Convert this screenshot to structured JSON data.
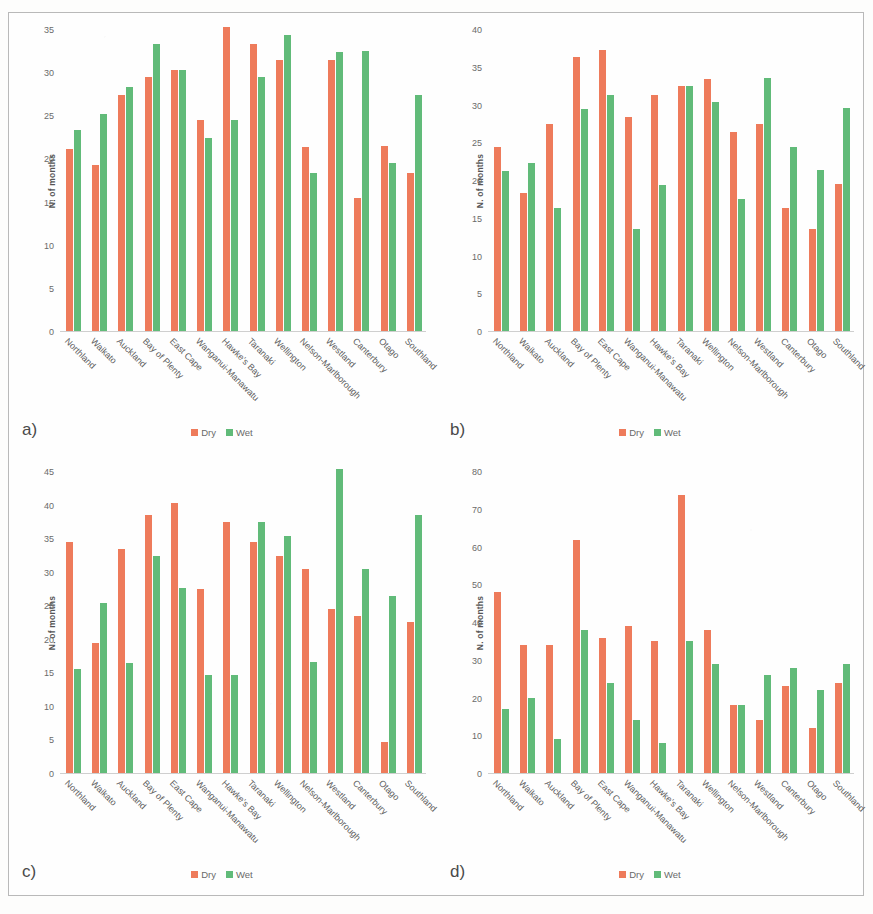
{
  "figure": {
    "colors": {
      "dry": "#ee7b5b",
      "wet": "#61bb79",
      "border": "#b9b9b9",
      "text": "#5e5e5e"
    },
    "legend": {
      "dry_label": "Dry",
      "wet_label": "Wet"
    },
    "ylabel": "N. of months",
    "categories": [
      "Northland",
      "Waikato",
      "Auckland",
      "Bay of Plenty",
      "East Cape",
      "Wanganui-Manawatu",
      "Hawke's Bay",
      "Taranaki",
      "Wellington",
      "Nelson-Marlborough",
      "Westland",
      "Canterbury",
      "Otago",
      "Southland"
    ],
    "panels": [
      {
        "letter": "a)"
      },
      {
        "letter": "b)"
      },
      {
        "letter": "c)"
      },
      {
        "letter": "d)"
      }
    ]
  },
  "chart_data": [
    {
      "type": "bar",
      "panel": "a)",
      "title": "",
      "xlabel": "",
      "ylabel": "N. of months",
      "ylim": [
        0,
        35
      ],
      "yticks": [
        0,
        5,
        10,
        15,
        20,
        25,
        30,
        35
      ],
      "grid": false,
      "legend_position": "bottom-center",
      "categories": [
        "Northland",
        "Waikato",
        "Auckland",
        "Bay of Plenty",
        "East Cape",
        "Wanganui-Manawatu",
        "Hawke's Bay",
        "Taranaki",
        "Wellington",
        "Nelson-Marlborough",
        "Westland",
        "Canterbury",
        "Otago",
        "Southland"
      ],
      "series": [
        {
          "name": "Dry",
          "color": "#ee7b5b",
          "values": [
            21.2,
            19.3,
            27.4,
            29.5,
            30.4,
            24.5,
            35.4,
            33.4,
            31.5,
            21.4,
            31.5,
            15.5,
            21.5,
            18.4
          ]
        },
        {
          "name": "Wet",
          "color": "#61bb79",
          "values": [
            23.4,
            25.2,
            28.4,
            33.4,
            30.4,
            22.4,
            24.5,
            29.5,
            34.4,
            18.4,
            32.5,
            32.6,
            19.5,
            27.5
          ]
        }
      ]
    },
    {
      "type": "bar",
      "panel": "b)",
      "title": "",
      "xlabel": "",
      "ylabel": "N. of months",
      "ylim": [
        0,
        40
      ],
      "yticks": [
        0,
        5,
        10,
        15,
        20,
        25,
        30,
        35,
        40
      ],
      "grid": false,
      "legend_position": "bottom-center",
      "categories": [
        "Northland",
        "Waikato",
        "Auckland",
        "Bay of Plenty",
        "East Cape",
        "Wanganui-Manawatu",
        "Hawke's Bay",
        "Taranaki",
        "Wellington",
        "Nelson-Marlborough",
        "Westland",
        "Canterbury",
        "Otago",
        "Southland"
      ],
      "series": [
        {
          "name": "Dry",
          "color": "#ee7b5b",
          "values": [
            24.5,
            18.3,
            27.5,
            36.4,
            37.4,
            28.5,
            31.4,
            32.5,
            33.5,
            26.5,
            27.5,
            16.4,
            13.5,
            19.5
          ]
        },
        {
          "name": "Wet",
          "color": "#61bb79",
          "values": [
            21.3,
            22.3,
            16.4,
            29.5,
            31.4,
            13.5,
            19.4,
            32.5,
            30.5,
            17.5,
            33.6,
            24.5,
            21.4,
            29.6
          ]
        }
      ]
    },
    {
      "type": "bar",
      "panel": "c)",
      "title": "",
      "xlabel": "",
      "ylabel": "N. of months",
      "ylim": [
        0,
        45
      ],
      "yticks": [
        0,
        5,
        10,
        15,
        20,
        25,
        30,
        35,
        40,
        45
      ],
      "grid": false,
      "legend_position": "bottom-center",
      "categories": [
        "Northland",
        "Waikato",
        "Auckland",
        "Bay of Plenty",
        "East Cape",
        "Wanganui-Manawatu",
        "Hawke's Bay",
        "Taranaki",
        "Wellington",
        "Nelson-Marlborough",
        "Westland",
        "Canterbury",
        "Otago",
        "Southland"
      ],
      "series": [
        {
          "name": "Dry",
          "color": "#ee7b5b",
          "values": [
            34.5,
            19.5,
            33.5,
            38.5,
            40.4,
            27.5,
            37.5,
            34.6,
            32.5,
            30.5,
            24.5,
            23.5,
            4.6,
            22.6
          ]
        },
        {
          "name": "Wet",
          "color": "#61bb79",
          "values": [
            15.5,
            25.4,
            16.4,
            32.5,
            27.6,
            14.6,
            14.6,
            37.6,
            35.5,
            16.6,
            45.4,
            30.5,
            26.5,
            38.5
          ]
        }
      ]
    },
    {
      "type": "bar",
      "panel": "d)",
      "title": "",
      "xlabel": "",
      "ylabel": "N. of months",
      "ylim": [
        0,
        80
      ],
      "yticks": [
        0,
        10,
        20,
        30,
        40,
        50,
        60,
        70,
        80
      ],
      "grid": false,
      "legend_position": "bottom-center",
      "categories": [
        "Northland",
        "Waikato",
        "Auckland",
        "Bay of Plenty",
        "East Cape",
        "Wanganui-Manawatu",
        "Hawke's Bay",
        "Taranaki",
        "Wellington",
        "Nelson-Marlborough",
        "Westland",
        "Canterbury",
        "Otago",
        "Southland"
      ],
      "series": [
        {
          "name": "Dry",
          "color": "#ee7b5b",
          "values": [
            48,
            34,
            34,
            62,
            36,
            39,
            35,
            74,
            38,
            18,
            14,
            23,
            12,
            24
          ]
        },
        {
          "name": "Wet",
          "color": "#61bb79",
          "values": [
            17,
            20,
            9,
            38,
            24,
            14,
            8,
            35,
            29,
            18,
            26,
            28,
            22,
            29
          ]
        }
      ]
    }
  ]
}
